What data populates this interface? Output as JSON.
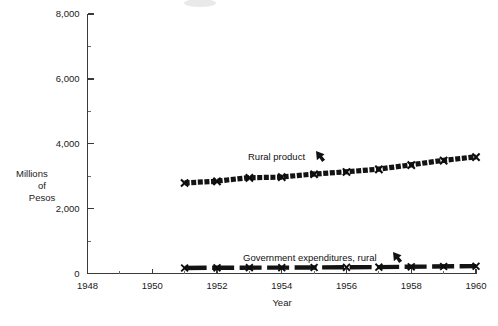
{
  "chart_data": {
    "type": "line",
    "title": "",
    "xlabel": "Year",
    "ylabel": "Millions of Pesos",
    "ylabel_lines": [
      "Millions",
      "of",
      "Pesos"
    ],
    "xlim": [
      1948,
      1960
    ],
    "ylim": [
      0,
      8000
    ],
    "grid": false,
    "legend_position": "inline-annotations",
    "x_ticks": [
      1948,
      1950,
      1952,
      1954,
      1956,
      1958,
      1960
    ],
    "x_tick_labels": [
      "1948",
      "1950",
      "1952",
      "1954",
      "1956",
      "1958",
      "1960"
    ],
    "x_minor_ticks": [
      1949,
      1951,
      1953,
      1955,
      1957,
      1959
    ],
    "y_ticks": [
      0,
      2000,
      4000,
      6000,
      8000
    ],
    "y_tick_labels": [
      "0",
      "2,000",
      "4,000",
      "6,000",
      "8,000"
    ],
    "y_minor_ticks": [
      1000,
      3000,
      5000,
      7000
    ],
    "series": [
      {
        "name": "Rural product",
        "annotation": "Rural product",
        "marker": "x",
        "x": [
          1951,
          1952,
          1953,
          1954,
          1955,
          1956,
          1957,
          1958,
          1959,
          1960
        ],
        "values": [
          2790,
          2840,
          2950,
          2970,
          3060,
          3130,
          3210,
          3340,
          3480,
          3590
        ]
      },
      {
        "name": "Government expenditures, rural",
        "annotation": "Government expenditures, rural",
        "marker": "x",
        "x": [
          1951,
          1952,
          1953,
          1954,
          1955,
          1956,
          1957,
          1958,
          1959,
          1960
        ],
        "values": [
          170,
          175,
          180,
          180,
          185,
          190,
          195,
          205,
          215,
          225
        ]
      }
    ]
  },
  "annotations": [
    {
      "label": "Rural product",
      "x": 1951,
      "text_x_px": 248,
      "text_y_px": 157
    },
    {
      "label": "Government expenditures, rural",
      "x": 1951,
      "text_x_px": 243,
      "text_y_px": 258
    }
  ],
  "axis_titles": {
    "x": "Year",
    "y_line1": "Millions",
    "y_line2": "of",
    "y_line3": "Pesos"
  },
  "colors": {
    "series_ink": "#131313",
    "axis": "#3a3a3a",
    "text": "#111111",
    "background": "#ffffff"
  }
}
